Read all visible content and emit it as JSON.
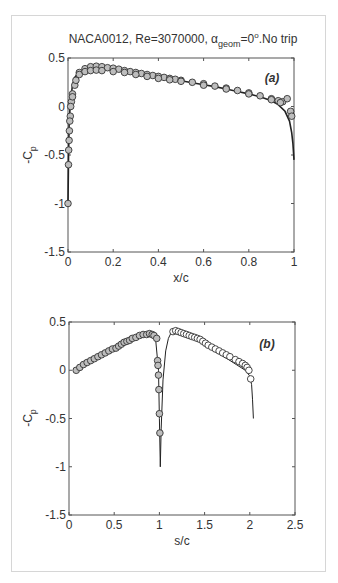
{
  "figure": {
    "title_prefix": "NACA0012, Re=3070000, ",
    "title_alpha": "α",
    "title_sub": "geom",
    "title_eq": "=0",
    "title_sup": "o",
    "title_suffix": ".No trip"
  },
  "colors": {
    "axis": "#555555",
    "line": "#222222",
    "marker_fill_a": "#bdbdbd",
    "marker_fill_b_left": "#bdbdbd",
    "marker_fill_b_right": "#ffffff",
    "marker_edge": "#333333",
    "frame": "#d6d6d6"
  },
  "chart_data": [
    {
      "type": "line",
      "panel_label": "(a)",
      "title": "NACA0012, Re=3070000, α_geom=0°.No trip",
      "xlabel": "x/c",
      "ylabel": "-C_p",
      "xlim": [
        0,
        1
      ],
      "ylim": [
        -1.5,
        0.5
      ],
      "xticks": [
        0,
        0.2,
        0.4,
        0.6,
        0.8,
        1
      ],
      "xtick_labels": [
        "0",
        "0.2",
        "0.4",
        "0.6",
        "0.8",
        "1"
      ],
      "yticks": [
        0.5,
        0,
        -0.5,
        -1,
        -1.5
      ],
      "ytick_labels": [
        "0.5",
        "0",
        "-0.5",
        "-1",
        "-1.5"
      ],
      "grid": false,
      "series": [
        {
          "name": "computed",
          "style": "line",
          "x": [
            0,
            0.002,
            0.005,
            0.01,
            0.02,
            0.03,
            0.05,
            0.08,
            0.1,
            0.13,
            0.16,
            0.2,
            0.25,
            0.3,
            0.35,
            0.4,
            0.45,
            0.5,
            0.55,
            0.6,
            0.65,
            0.7,
            0.75,
            0.8,
            0.85,
            0.9,
            0.93,
            0.96,
            0.98,
            0.99,
            0.995,
            1.0
          ],
          "y": [
            -1.0,
            -0.55,
            -0.2,
            0.05,
            0.22,
            0.3,
            0.36,
            0.39,
            0.4,
            0.4,
            0.395,
            0.385,
            0.37,
            0.35,
            0.33,
            0.31,
            0.29,
            0.265,
            0.245,
            0.225,
            0.205,
            0.18,
            0.155,
            0.13,
            0.1,
            0.06,
            0.02,
            -0.05,
            -0.15,
            -0.27,
            -0.38,
            -0.55
          ]
        },
        {
          "name": "experiment upper",
          "style": "marker",
          "x": [
            0,
            0.003,
            0.006,
            0.01,
            0.015,
            0.02,
            0.03,
            0.05,
            0.075,
            0.1,
            0.125,
            0.15,
            0.175,
            0.2,
            0.225,
            0.25,
            0.275,
            0.3,
            0.325,
            0.35,
            0.375,
            0.4,
            0.425,
            0.45,
            0.475,
            0.5,
            0.55,
            0.6,
            0.65,
            0.7,
            0.75,
            0.8,
            0.85,
            0.9,
            0.93,
            0.95,
            0.97,
            0.985,
            0.99
          ],
          "y": [
            -1.0,
            -0.45,
            -0.25,
            -0.1,
            0.05,
            0.13,
            0.22,
            0.35,
            0.39,
            0.41,
            0.415,
            0.41,
            0.4,
            0.395,
            0.385,
            0.37,
            0.36,
            0.35,
            0.34,
            0.33,
            0.32,
            0.31,
            0.3,
            0.29,
            0.28,
            0.27,
            0.25,
            0.235,
            0.21,
            0.19,
            0.165,
            0.14,
            0.11,
            0.08,
            0.06,
            0.05,
            0.08,
            -0.05,
            -0.1
          ]
        },
        {
          "name": "experiment lower",
          "style": "marker",
          "x": [
            0.002,
            0.005,
            0.008,
            0.012,
            0.02,
            0.035,
            0.05,
            0.075,
            0.1,
            0.125,
            0.15,
            0.2,
            0.25,
            0.3,
            0.35,
            0.4,
            0.45,
            0.5,
            0.6,
            0.7,
            0.8,
            0.9,
            0.94
          ],
          "y": [
            -0.6,
            -0.35,
            -0.15,
            0.0,
            0.1,
            0.27,
            0.33,
            0.36,
            0.37,
            0.375,
            0.37,
            0.36,
            0.35,
            0.33,
            0.31,
            0.29,
            0.275,
            0.26,
            0.22,
            0.18,
            0.13,
            0.07,
            0.04
          ]
        }
      ]
    },
    {
      "type": "line",
      "panel_label": "(b)",
      "xlabel": "s/c",
      "ylabel": "-C_p",
      "xlim": [
        0,
        2.5
      ],
      "ylim": [
        -1.5,
        0.5
      ],
      "xticks": [
        0,
        0.5,
        1,
        1.5,
        2,
        2.5
      ],
      "xtick_labels": [
        "0",
        "0.5",
        "1",
        "1.5",
        "2",
        "2.5"
      ],
      "yticks": [
        0.5,
        0,
        -0.5,
        -1,
        -1.5
      ],
      "ytick_labels": [
        "0.5",
        "0",
        "-0.5",
        "-1",
        "-1.5"
      ],
      "grid": false,
      "series": [
        {
          "name": "computed",
          "style": "line",
          "x": [
            0.08,
            0.2,
            0.4,
            0.6,
            0.75,
            0.85,
            0.92,
            0.96,
            0.99,
            1.0,
            1.01,
            1.02,
            1.04,
            1.07,
            1.1,
            1.13,
            1.18,
            1.3,
            1.45,
            1.6,
            1.75,
            1.85,
            1.95,
            2.0,
            2.02,
            2.03,
            2.04
          ],
          "y": [
            0.0,
            0.07,
            0.16,
            0.26,
            0.34,
            0.38,
            0.38,
            0.3,
            0.0,
            -0.5,
            -1.0,
            -0.6,
            -0.1,
            0.2,
            0.33,
            0.39,
            0.41,
            0.37,
            0.29,
            0.2,
            0.12,
            0.06,
            0.0,
            -0.06,
            -0.15,
            -0.3,
            -0.5
          ]
        },
        {
          "name": "experiment side 1",
          "style": "marker",
          "fill": "marker_fill_b_left",
          "x": [
            0.08,
            0.12,
            0.16,
            0.2,
            0.24,
            0.28,
            0.32,
            0.36,
            0.4,
            0.44,
            0.48,
            0.52,
            0.55,
            0.58,
            0.61,
            0.64,
            0.67,
            0.7,
            0.74,
            0.78,
            0.82,
            0.86,
            0.89,
            0.92,
            0.94,
            0.97,
            0.98,
            0.985,
            0.99,
            0.995,
            1.0,
            1.005
          ],
          "y": [
            0.0,
            0.03,
            0.06,
            0.08,
            0.1,
            0.12,
            0.14,
            0.16,
            0.18,
            0.2,
            0.22,
            0.23,
            0.25,
            0.27,
            0.29,
            0.3,
            0.31,
            0.33,
            0.34,
            0.36,
            0.37,
            0.37,
            0.38,
            0.37,
            0.36,
            0.33,
            0.1,
            0.05,
            -0.05,
            -0.2,
            -0.45,
            -0.65
          ]
        },
        {
          "name": "experiment side 2",
          "style": "marker",
          "fill": "marker_fill_b_right",
          "x": [
            1.15,
            1.18,
            1.21,
            1.24,
            1.27,
            1.3,
            1.33,
            1.36,
            1.39,
            1.42,
            1.45,
            1.48,
            1.51,
            1.54,
            1.58,
            1.62,
            1.66,
            1.7,
            1.74,
            1.78,
            1.84,
            1.88,
            1.92,
            1.95,
            1.97,
            1.99,
            2.01
          ],
          "y": [
            0.4,
            0.41,
            0.4,
            0.39,
            0.38,
            0.37,
            0.36,
            0.35,
            0.34,
            0.33,
            0.32,
            0.3,
            0.28,
            0.26,
            0.24,
            0.22,
            0.2,
            0.18,
            0.16,
            0.14,
            0.11,
            0.09,
            0.07,
            0.05,
            0.03,
            0.0,
            -0.09
          ]
        }
      ]
    }
  ]
}
